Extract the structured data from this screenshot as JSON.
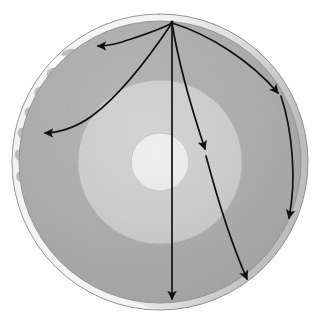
{
  "figure": {
    "title": "Earth cutaway with seismic ray paths",
    "type": "cross-section-diagram",
    "background_color": "#ffffff",
    "width": 313,
    "height": 323
  },
  "globe": {
    "center": {
      "x": 160,
      "y": 162
    },
    "outer_radius": 148,
    "surface_shell": {
      "name": "earth-surface-crust",
      "label": "Earth surface",
      "color": "#d8d8d8",
      "highlight_color": "#f2f2f2",
      "texture": "continents-and-clouds",
      "visible_arc": "left-limb"
    }
  },
  "layers": [
    {
      "name": "mantle",
      "label": "Mantle",
      "radius": 141,
      "color": "#a8a8a8",
      "stroke": "#9a9a9a"
    },
    {
      "name": "outer-core",
      "label": "Outer core",
      "radius": 82,
      "color": "#cfcfcf",
      "stroke": "#b8b8b8"
    },
    {
      "name": "inner-core",
      "label": "Inner core",
      "radius": 29,
      "color": "#ececec",
      "stroke": "#c9c9c9"
    }
  ],
  "epicenter": {
    "name": "earthquake-focus",
    "label": "Earthquake focus",
    "x": 172,
    "y": 22
  },
  "rays": [
    {
      "id": "ray-1",
      "label": "Ray to upper-left surface",
      "path": "M172,22 C150,60 120,100 104,128 L98,140",
      "arrow_tip": {
        "x": 96,
        "y": 44
      },
      "arrow_angle": -125,
      "head_path": "M172,22 C160,58 132,82 110,78 L100,46",
      "color": "#111111",
      "width": 1.7
    },
    {
      "id": "ray-2",
      "label": "Ray to left limb",
      "arrow_tip": {
        "x": 42,
        "y": 133
      },
      "arrow_angle": 186,
      "color": "#111111",
      "width": 1.7
    },
    {
      "id": "ray-3",
      "label": "Ray to lower-left mantle",
      "arrow_tip": {
        "x": 132,
        "y": 160
      },
      "arrow_angle": 190,
      "color": "#111111",
      "width": 1.7
    },
    {
      "id": "ray-4",
      "label": "Vertical ray through core to antipode",
      "arrow_tip": {
        "x": 172,
        "y": 302
      },
      "arrow_angle": 90,
      "color": "#111111",
      "width": 1.7
    },
    {
      "id": "ray-5",
      "label": "Ray refracted into outer core",
      "arrow_tip": {
        "x": 208,
        "y": 154
      },
      "arrow_angle": 62,
      "color": "#111111",
      "width": 1.7
    },
    {
      "id": "ray-6",
      "label": "Ray to lower-right surface",
      "arrow_tip": {
        "x": 251,
        "y": 283
      },
      "arrow_angle": 63,
      "color": "#111111",
      "width": 1.7
    },
    {
      "id": "ray-7",
      "label": "Ray to right limb",
      "arrow_tip": {
        "x": 283,
        "y": 96
      },
      "arrow_angle": 18,
      "color": "#111111",
      "width": 1.7
    },
    {
      "id": "ray-8",
      "label": "Ray down right limb",
      "arrow_tip": {
        "x": 291,
        "y": 223
      },
      "arrow_angle": 83,
      "color": "#111111",
      "width": 1.7
    }
  ],
  "annotations": {
    "arrow_count": 8,
    "arrowhead_color": "#111111",
    "line_color": "#111111"
  }
}
